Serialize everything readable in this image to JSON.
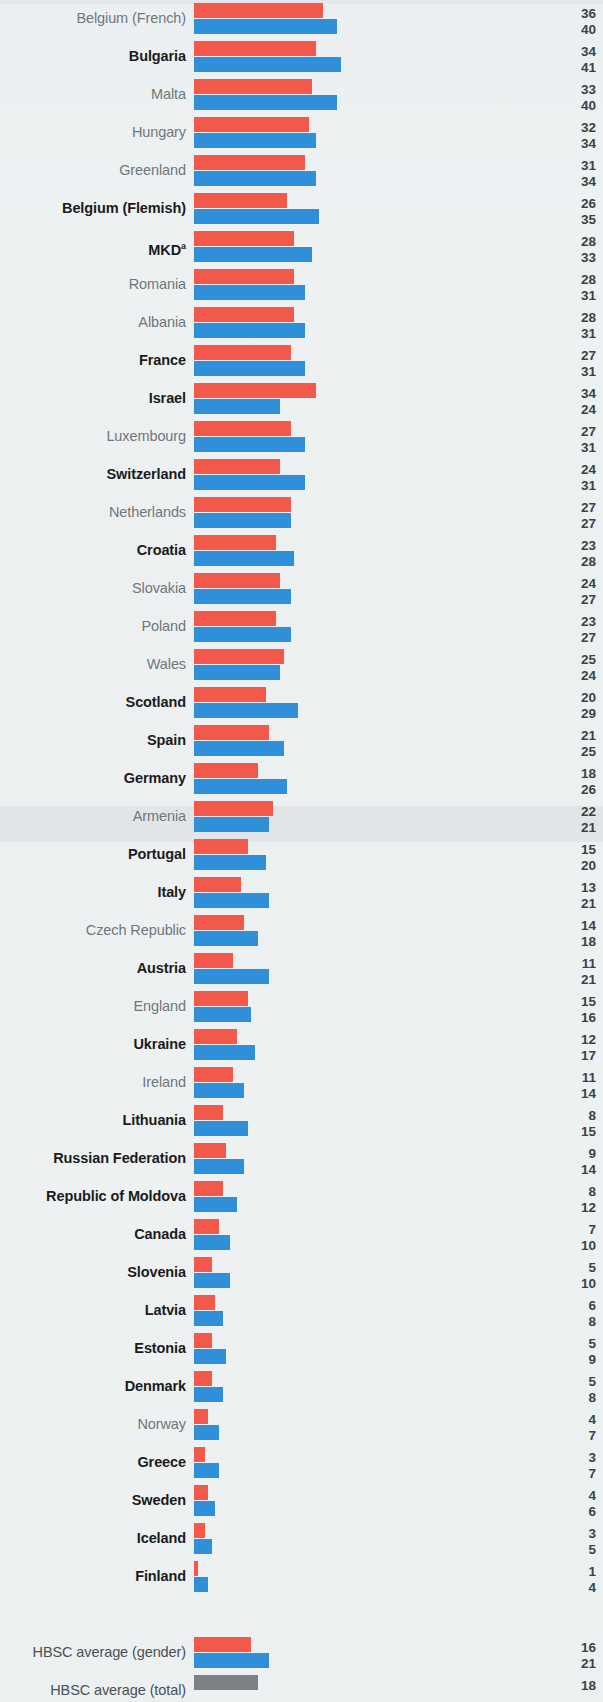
{
  "chart_data": {
    "type": "bar",
    "orientation": "horizontal",
    "title": "",
    "xlabel": "",
    "ylabel": "",
    "grid": false,
    "legend_position": "none",
    "xlim": [
      0,
      45
    ],
    "value_label_format": "integer percent",
    "series": [
      {
        "name": "girls",
        "color": "#f2594b"
      },
      {
        "name": "boys",
        "color": "#2f8fd8"
      },
      {
        "name": "total",
        "color": "#7d8184"
      }
    ],
    "categories": [
      "Belgium (French)",
      "Bulgaria",
      "Malta",
      "Hungary",
      "Greenland",
      "Belgium (Flemish)",
      "MKD",
      "Romania",
      "Albania",
      "France",
      "Israel",
      "Luxembourg",
      "Switzerland",
      "Netherlands",
      "Croatia",
      "Slovakia",
      "Poland",
      "Wales",
      "Scotland",
      "Spain",
      "Germany",
      "Armenia",
      "Portugal",
      "Italy",
      "Czech Republic",
      "Austria",
      "England",
      "Ukraine",
      "Ireland",
      "Lithuania",
      "Russian Federation",
      "Republic of Moldova",
      "Canada",
      "Slovenia",
      "Latvia",
      "Estonia",
      "Denmark",
      "Norway",
      "Greece",
      "Sweden",
      "Iceland",
      "Finland"
    ],
    "girls_values": [
      36,
      34,
      33,
      32,
      31,
      26,
      28,
      28,
      28,
      27,
      34,
      27,
      24,
      27,
      23,
      24,
      23,
      25,
      20,
      21,
      18,
      22,
      15,
      13,
      14,
      11,
      15,
      12,
      11,
      8,
      9,
      8,
      7,
      5,
      6,
      5,
      5,
      4,
      3,
      4,
      3,
      1
    ],
    "boys_values": [
      40,
      41,
      40,
      34,
      34,
      35,
      33,
      31,
      31,
      31,
      24,
      31,
      31,
      27,
      28,
      27,
      27,
      24,
      29,
      25,
      26,
      21,
      20,
      21,
      18,
      21,
      16,
      17,
      14,
      15,
      14,
      12,
      10,
      10,
      8,
      9,
      8,
      7,
      7,
      6,
      5,
      4
    ],
    "averages": [
      {
        "label": "HBSC average (gender)",
        "girls": 16,
        "boys": 21
      },
      {
        "label": "HBSC average (total)",
        "total": 18
      }
    ]
  },
  "rows": [
    {
      "label": "Belgium (French)",
      "bold": false,
      "girls": 36,
      "boys": 40
    },
    {
      "label": "Bulgaria",
      "bold": true,
      "girls": 34,
      "boys": 41
    },
    {
      "label": "Malta",
      "bold": false,
      "girls": 33,
      "boys": 40
    },
    {
      "label": "Hungary",
      "bold": false,
      "girls": 32,
      "boys": 34
    },
    {
      "label": "Greenland",
      "bold": false,
      "girls": 31,
      "boys": 34
    },
    {
      "label": "Belgium (Flemish)",
      "bold": true,
      "girls": 26,
      "boys": 35
    },
    {
      "label": "MKD",
      "bold": true,
      "girls": 28,
      "boys": 33,
      "sup": "a"
    },
    {
      "label": "Romania",
      "bold": false,
      "girls": 28,
      "boys": 31
    },
    {
      "label": "Albania",
      "bold": false,
      "girls": 28,
      "boys": 31
    },
    {
      "label": "France",
      "bold": true,
      "girls": 27,
      "boys": 31
    },
    {
      "label": "Israel",
      "bold": true,
      "girls": 34,
      "boys": 24
    },
    {
      "label": "Luxembourg",
      "bold": false,
      "girls": 27,
      "boys": 31
    },
    {
      "label": "Switzerland",
      "bold": true,
      "girls": 24,
      "boys": 31
    },
    {
      "label": "Netherlands",
      "bold": false,
      "girls": 27,
      "boys": 27
    },
    {
      "label": "Croatia",
      "bold": true,
      "girls": 23,
      "boys": 28
    },
    {
      "label": "Slovakia",
      "bold": false,
      "girls": 24,
      "boys": 27
    },
    {
      "label": "Poland",
      "bold": false,
      "girls": 23,
      "boys": 27
    },
    {
      "label": "Wales",
      "bold": false,
      "girls": 25,
      "boys": 24
    },
    {
      "label": "Scotland",
      "bold": true,
      "girls": 20,
      "boys": 29
    },
    {
      "label": "Spain",
      "bold": true,
      "girls": 21,
      "boys": 25
    },
    {
      "label": "Germany",
      "bold": true,
      "girls": 18,
      "boys": 26
    },
    {
      "label": "Armenia",
      "bold": false,
      "girls": 22,
      "boys": 21
    },
    {
      "label": "Portugal",
      "bold": true,
      "girls": 15,
      "boys": 20
    },
    {
      "label": "Italy",
      "bold": true,
      "girls": 13,
      "boys": 21
    },
    {
      "label": "Czech Republic",
      "bold": false,
      "girls": 14,
      "boys": 18
    },
    {
      "label": "Austria",
      "bold": true,
      "girls": 11,
      "boys": 21
    },
    {
      "label": "England",
      "bold": false,
      "girls": 15,
      "boys": 16
    },
    {
      "label": "Ukraine",
      "bold": true,
      "girls": 12,
      "boys": 17
    },
    {
      "label": "Ireland",
      "bold": false,
      "girls": 11,
      "boys": 14
    },
    {
      "label": "Lithuania",
      "bold": true,
      "girls": 8,
      "boys": 15
    },
    {
      "label": "Russian Federation",
      "bold": true,
      "girls": 9,
      "boys": 14
    },
    {
      "label": "Republic of Moldova",
      "bold": true,
      "girls": 8,
      "boys": 12
    },
    {
      "label": "Canada",
      "bold": true,
      "girls": 7,
      "boys": 10
    },
    {
      "label": "Slovenia",
      "bold": true,
      "girls": 5,
      "boys": 10
    },
    {
      "label": "Latvia",
      "bold": true,
      "girls": 6,
      "boys": 8
    },
    {
      "label": "Estonia",
      "bold": true,
      "girls": 5,
      "boys": 9
    },
    {
      "label": "Denmark",
      "bold": true,
      "girls": 5,
      "boys": 8
    },
    {
      "label": "Norway",
      "bold": false,
      "girls": 4,
      "boys": 7
    },
    {
      "label": "Greece",
      "bold": true,
      "girls": 3,
      "boys": 7
    },
    {
      "label": "Sweden",
      "bold": true,
      "girls": 4,
      "boys": 6
    },
    {
      "label": "Iceland",
      "bold": true,
      "girls": 3,
      "boys": 5
    },
    {
      "label": "Finland",
      "bold": true,
      "girls": 1,
      "boys": 4
    }
  ],
  "averages": [
    {
      "label": "HBSC average (gender)",
      "girls": 16,
      "boys": 21,
      "kind": "gender"
    },
    {
      "label": "HBSC average (total)",
      "total": 18,
      "kind": "total"
    }
  ],
  "scale": {
    "px_per_unit": 3.58,
    "bar_origin_x": 194
  },
  "colors": {
    "girls": "#f2594b",
    "boys": "#2f8fd8",
    "total": "#7d8184",
    "label_regular": "#6f777b",
    "label_bold": "#1b1b1b",
    "value": "#3b4245",
    "background": "#eef1f2"
  }
}
